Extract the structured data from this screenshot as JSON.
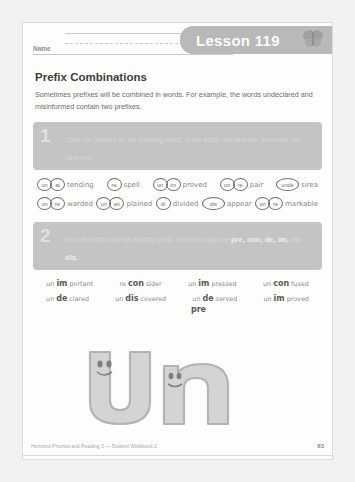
{
  "header": {
    "lesson_label": "Lesson 119",
    "name_label": "Name",
    "butterfly_icon": "butterfly-icon"
  },
  "title": "Prefix Combinations",
  "intro": "Sometimes prefixes will be combined in words. For example, the words undeclared and misinformed contain two prefixes.",
  "section1": {
    "number": "1",
    "instruction": "Circle the prefixes for the following words. Some words will have two and some will have one.",
    "rows": [
      [
        {
          "p1": "un",
          "p2": "at",
          "stem": "tending"
        },
        {
          "p1": "re",
          "p2": "",
          "stem": "spell"
        },
        {
          "p1": "un",
          "p2": "im",
          "stem": "proved"
        },
        {
          "p1": "un",
          "p2": "re",
          "stem": "pair"
        },
        {
          "p1": "unde",
          "p2": "",
          "stem": "sirea"
        }
      ],
      [
        {
          "p1": "un",
          "p2": "re",
          "stem": "warded"
        },
        {
          "p1": "un",
          "p2": "ex",
          "stem": "plained"
        },
        {
          "p1": "di",
          "p2": "",
          "stem": "divided"
        },
        {
          "p1": "dis",
          "p2": "",
          "stem": "appear"
        },
        {
          "p1": "un",
          "p2": "re",
          "stem": "markable"
        }
      ]
    ]
  },
  "section2": {
    "number": "2",
    "instruction_lead": "Fill in the blank with the missing prefix. Prefixes to use are",
    "instruction_bold": "pre, con, de, im,",
    "instruction_tail": "and",
    "instruction_bold2": "dis.",
    "rows": [
      [
        {
          "pre": "un",
          "fill": "im",
          "suf": "portant"
        },
        {
          "pre": "re",
          "fill": "con",
          "suf": "sider"
        },
        {
          "pre": "un",
          "fill": "im",
          "suf": "pressed"
        },
        {
          "pre": "un",
          "fill": "con",
          "suf": "fused"
        }
      ],
      [
        {
          "pre": "un",
          "fill": "de",
          "suf": "clared"
        },
        {
          "pre": "un",
          "fill": "dis",
          "suf": "covered"
        },
        {
          "pre": "un",
          "fill": "de",
          "suf": "served"
        },
        {
          "pre": "un",
          "fill": "im",
          "suf": "proved"
        }
      ]
    ],
    "stray_word": "pre"
  },
  "decoration": {
    "big_word": "un",
    "icon_name": "big-un-letters-art"
  },
  "footer": {
    "credit": "Horizons Phonics and Reading 3 — Student Workbook 2",
    "page_number": "83"
  }
}
